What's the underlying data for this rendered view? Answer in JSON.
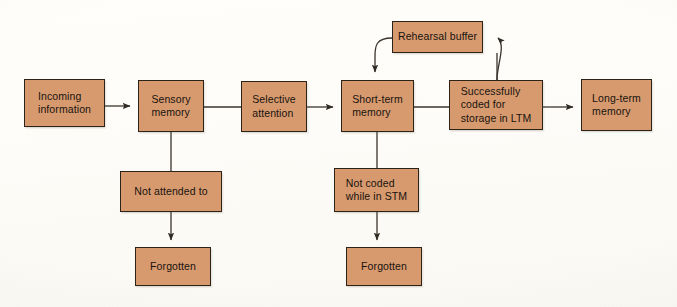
{
  "diagram": {
    "type": "flowchart",
    "background_color": "#fdfdfb",
    "node_fill_color": "#d79a6f",
    "node_border_color": "#2b2218",
    "connector_color": "#3a342c",
    "nodes": [
      {
        "id": "incoming-information",
        "label": "Incoming\ninformation",
        "x": 24,
        "y": 79,
        "w": 81,
        "h": 48,
        "align": "left"
      },
      {
        "id": "sensory-memory",
        "label": "Sensory\nmemory",
        "x": 138,
        "y": 80,
        "w": 66,
        "h": 52,
        "align": "left"
      },
      {
        "id": "selective-attention",
        "label": "Selective\nattention",
        "x": 241,
        "y": 81,
        "w": 66,
        "h": 51,
        "align": "left"
      },
      {
        "id": "short-term-memory",
        "label": "Short-term\nmemory",
        "x": 341,
        "y": 80,
        "w": 73,
        "h": 52,
        "align": "left"
      },
      {
        "id": "successfully-coded-for-storage-in-ltm",
        "label": "Successfully\ncoded for\nstorage in LTM",
        "x": 449,
        "y": 80,
        "w": 94,
        "h": 50,
        "align": "left"
      },
      {
        "id": "long-term-memory",
        "label": "Long-term\nmemory",
        "x": 581,
        "y": 79,
        "w": 71,
        "h": 52,
        "align": "left"
      },
      {
        "id": "rehearsal-buffer",
        "label": "Rehearsal buffer",
        "x": 392,
        "y": 21,
        "w": 91,
        "h": 32,
        "align": "center"
      },
      {
        "id": "not-attended-to",
        "label": "Not attended to",
        "x": 120,
        "y": 171,
        "w": 102,
        "h": 41,
        "align": "center"
      },
      {
        "id": "forgotten-sensory",
        "label": "Forgotten",
        "x": 135,
        "y": 247,
        "w": 76,
        "h": 39,
        "align": "center"
      },
      {
        "id": "not-coded-while-in-stm",
        "label": "Not coded\nwhile in STM",
        "x": 334,
        "y": 168,
        "w": 85,
        "h": 44,
        "align": "left"
      },
      {
        "id": "forgotten-stm",
        "label": "Forgotten",
        "x": 346,
        "y": 247,
        "w": 76,
        "h": 39,
        "align": "center"
      }
    ],
    "connectors": [
      {
        "id": "incoming-to-sensory",
        "from": "incoming-information",
        "to": "sensory-memory",
        "arrow": true
      },
      {
        "id": "sensory-to-selective",
        "from": "sensory-memory",
        "to": "selective-attention",
        "arrow": false
      },
      {
        "id": "selective-to-stm",
        "from": "selective-attention",
        "to": "short-term-memory",
        "arrow": true
      },
      {
        "id": "stm-to-successfully-coded",
        "from": "short-term-memory",
        "to": "successfully-coded-for-storage-in-ltm",
        "arrow": false
      },
      {
        "id": "successfully-coded-to-ltm",
        "from": "successfully-coded-for-storage-in-ltm",
        "to": "long-term-memory",
        "arrow": true
      },
      {
        "id": "successfully-coded-to-rehearsal-buffer",
        "from": "successfully-coded-for-storage-in-ltm",
        "to": "rehearsal-buffer",
        "arrow": true,
        "style": "curved"
      },
      {
        "id": "rehearsal-buffer-to-stm",
        "from": "rehearsal-buffer",
        "to": "short-term-memory",
        "arrow": true,
        "style": "curved"
      },
      {
        "id": "rehearsal-buffer-top-feed",
        "from": "rehearsal-buffer",
        "to": "successfully-coded-for-storage-in-ltm",
        "arrow": false,
        "style": "vertical"
      },
      {
        "id": "sensory-to-not-attended",
        "from": "sensory-memory",
        "to": "not-attended-to",
        "arrow": false
      },
      {
        "id": "not-attended-to-forgotten",
        "from": "not-attended-to",
        "to": "forgotten-sensory",
        "arrow": true
      },
      {
        "id": "stm-to-not-coded",
        "from": "short-term-memory",
        "to": "not-coded-while-in-stm",
        "arrow": false
      },
      {
        "id": "not-coded-to-forgotten",
        "from": "not-coded-while-in-stm",
        "to": "forgotten-stm",
        "arrow": true
      }
    ]
  }
}
